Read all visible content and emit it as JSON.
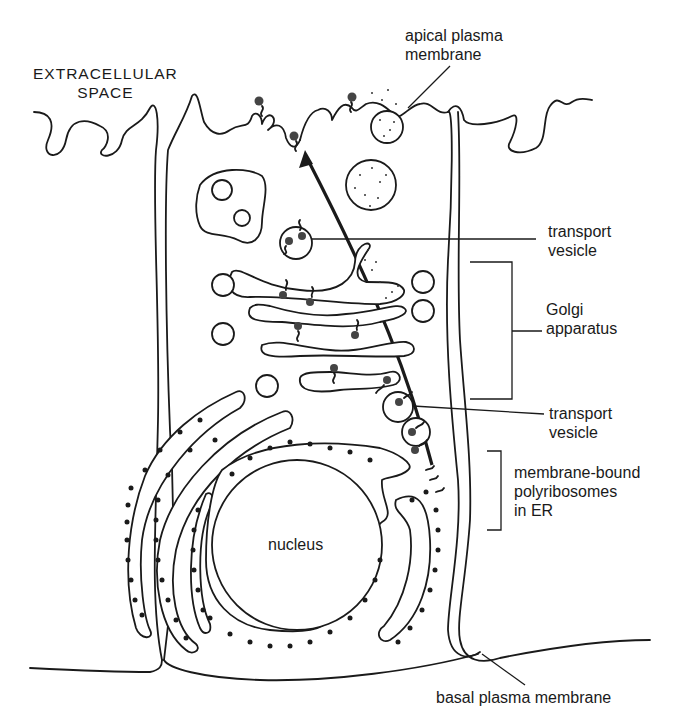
{
  "labels": {
    "extracellular": [
      "EXTRACELLULAR",
      "SPACE"
    ],
    "apical_membrane": [
      "apical plasma",
      "membrane"
    ],
    "transport_vesicle_top": [
      "transport",
      "vesicle"
    ],
    "golgi": [
      "Golgi",
      "apparatus"
    ],
    "transport_vesicle_bottom": [
      "transport",
      "vesicle"
    ],
    "polyribosomes": [
      "membrane-bound",
      "polyribosomes",
      "in ER"
    ],
    "nucleus": "nucleus",
    "basal_membrane": "basal plasma membrane"
  },
  "colors": {
    "ink": "#1a1a1a",
    "background": "#ffffff"
  }
}
